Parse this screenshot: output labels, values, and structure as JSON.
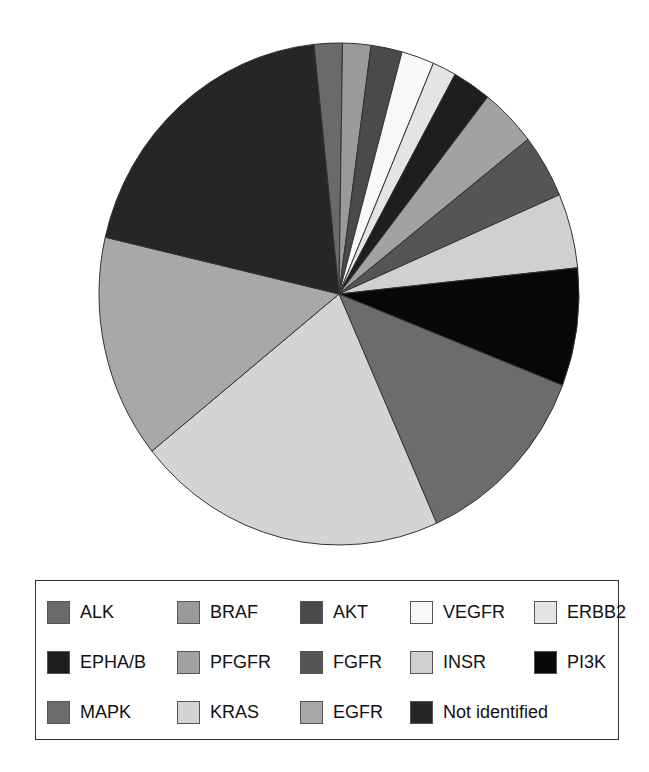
{
  "chart_data": {
    "type": "pie",
    "title": "",
    "start_angle_deg": -6.0,
    "direction": "clockwise",
    "slices": [
      {
        "label": "ALK",
        "value": 1.9,
        "color": "#6a6a6a"
      },
      {
        "label": "BRAF",
        "value": 1.9,
        "color": "#9a9a9a"
      },
      {
        "label": "AKT",
        "value": 2.1,
        "color": "#4a4a4a"
      },
      {
        "label": "VEGFR",
        "value": 2.2,
        "color": "#f8f8f8"
      },
      {
        "label": "ERBB2",
        "value": 1.6,
        "color": "#e4e4e4"
      },
      {
        "label": "EPHA/B",
        "value": 2.6,
        "color": "#1e1e1e"
      },
      {
        "label": "PFGFR",
        "value": 3.8,
        "color": "#a2a2a2"
      },
      {
        "label": "FGFR",
        "value": 4.1,
        "color": "#555555"
      },
      {
        "label": "INSR",
        "value": 4.8,
        "color": "#d0d0d0"
      },
      {
        "label": "PI3K",
        "value": 7.6,
        "color": "#080808"
      },
      {
        "label": "MAPK",
        "value": 12.4,
        "color": "#6c6c6c"
      },
      {
        "label": "KRAS",
        "value": 20.9,
        "color": "#d4d4d4"
      },
      {
        "label": "EGFR",
        "value": 14.4,
        "color": "#a8a8a8"
      },
      {
        "label": "Not identified",
        "value": 19.7,
        "color": "#262626"
      }
    ],
    "legend": {
      "position": "bottom",
      "columns": 5,
      "entries": [
        "ALK",
        "BRAF",
        "AKT",
        "VEGFR",
        "ERBB2",
        "EPHA/B",
        "PFGFR",
        "FGFR",
        "INSR",
        "PI3K",
        "MAPK",
        "KRAS",
        "EGFR",
        "Not identified"
      ]
    }
  },
  "legend": {
    "items": [
      {
        "label": "ALK",
        "color": "#6a6a6a"
      },
      {
        "label": "BRAF",
        "color": "#9a9a9a"
      },
      {
        "label": "AKT",
        "color": "#4a4a4a"
      },
      {
        "label": "VEGFR",
        "color": "#f8f8f8"
      },
      {
        "label": "ERBB2",
        "color": "#e4e4e4"
      },
      {
        "label": "EPHA/B",
        "color": "#1e1e1e"
      },
      {
        "label": "PFGFR",
        "color": "#a2a2a2"
      },
      {
        "label": "FGFR",
        "color": "#555555"
      },
      {
        "label": "INSR",
        "color": "#d0d0d0"
      },
      {
        "label": "PI3K",
        "color": "#080808"
      },
      {
        "label": "MAPK",
        "color": "#6c6c6c"
      },
      {
        "label": "KRAS",
        "color": "#d4d4d4"
      },
      {
        "label": "EGFR",
        "color": "#a8a8a8"
      },
      {
        "label": "Not identified",
        "color": "#262626"
      }
    ]
  }
}
